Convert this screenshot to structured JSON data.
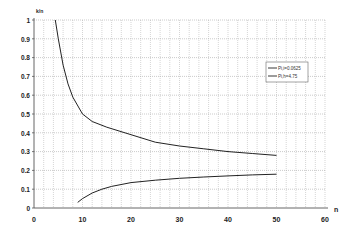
{
  "chart_data": {
    "type": "line",
    "title": "",
    "xlabel": "n",
    "ylabel": "k/n",
    "xlim": [
      0,
      60
    ],
    "ylim": [
      0,
      1
    ],
    "xticks": [
      0,
      10,
      20,
      30,
      40,
      50,
      60
    ],
    "yticks": [
      0,
      0.1,
      0.2,
      0.3,
      0.4,
      0.5,
      0.6,
      0.7,
      0.8,
      0.9,
      1
    ],
    "grid": true,
    "legend_position": "upper right",
    "series": [
      {
        "name": "Pi,i=0.0625",
        "x": [
          4.4,
          5,
          6,
          7,
          8,
          10,
          12,
          15,
          20,
          25,
          30,
          35,
          40,
          45,
          50
        ],
        "y": [
          1.0,
          0.9,
          0.76,
          0.66,
          0.59,
          0.5,
          0.46,
          0.43,
          0.39,
          0.35,
          0.33,
          0.315,
          0.3,
          0.29,
          0.28
        ]
      },
      {
        "name": "Pi,h=4.75",
        "x": [
          9,
          10,
          12,
          14,
          16,
          20,
          25,
          30,
          35,
          40,
          45,
          50
        ],
        "y": [
          0.03,
          0.05,
          0.08,
          0.1,
          0.115,
          0.135,
          0.148,
          0.158,
          0.165,
          0.171,
          0.176,
          0.18
        ]
      }
    ]
  }
}
